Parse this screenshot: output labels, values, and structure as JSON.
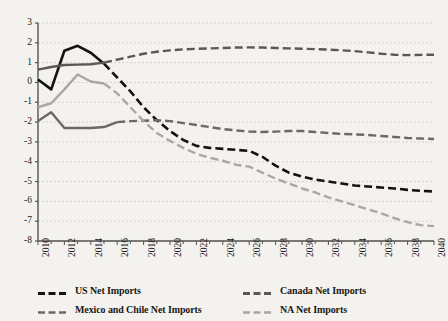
{
  "chart_data": {
    "type": "line",
    "title": "",
    "subtitle": "",
    "xlabel": "",
    "ylabel": "",
    "xlim": [
      2010,
      2040
    ],
    "ylim": [
      -8,
      3
    ],
    "grid": true,
    "legend_position": "bottom",
    "y_ticks": [
      3,
      2,
      1,
      0,
      -1,
      -2,
      -3,
      -4,
      -5,
      -6,
      -7,
      -8
    ],
    "y_tick_labels": [
      "3",
      "2",
      "1",
      "0",
      "-1",
      "-2",
      "-3",
      "-4",
      "-5",
      "-6",
      "-7",
      "-8"
    ],
    "x_ticks": [
      2010,
      2012,
      2014,
      2016,
      2018,
      2020,
      2022,
      2024,
      2026,
      2028,
      2030,
      2032,
      2034,
      2036,
      2038,
      2040
    ],
    "x_tick_labels": [
      "2010",
      "2012",
      "2014",
      "2016",
      "2018",
      "2020",
      "2022",
      "2024",
      "2026",
      "2028",
      "2030",
      "2032",
      "2034",
      "2036",
      "2038",
      "2040"
    ],
    "x": [
      2010,
      2011,
      2012,
      2013,
      2014,
      2015,
      2016,
      2017,
      2018,
      2019,
      2020,
      2021,
      2022,
      2023,
      2024,
      2025,
      2026,
      2027,
      2028,
      2029,
      2030,
      2031,
      2032,
      2033,
      2034,
      2035,
      2036,
      2037,
      2038,
      2039,
      2040
    ],
    "series": [
      {
        "name": "US Net Imports",
        "color": "#141210",
        "width": 2.6,
        "dash": "8,4",
        "solid_until": 2015,
        "values": [
          0.15,
          -0.35,
          1.6,
          1.85,
          1.5,
          0.95,
          0.25,
          -0.45,
          -1.25,
          -1.9,
          -2.45,
          -2.9,
          -3.2,
          -3.3,
          -3.35,
          -3.4,
          -3.45,
          -3.75,
          -4.2,
          -4.55,
          -4.75,
          -4.9,
          -5.0,
          -5.1,
          -5.2,
          -5.25,
          -5.3,
          -5.35,
          -5.42,
          -5.47,
          -5.5
        ]
      },
      {
        "name": "Canada Net Imports",
        "color": "#5a5852",
        "width": 2.4,
        "dash": "8,4",
        "solid_until": 2015,
        "values": [
          0.65,
          0.78,
          0.88,
          0.9,
          0.92,
          1.0,
          1.15,
          1.3,
          1.45,
          1.55,
          1.62,
          1.67,
          1.7,
          1.72,
          1.74,
          1.76,
          1.77,
          1.76,
          1.74,
          1.72,
          1.7,
          1.68,
          1.66,
          1.62,
          1.58,
          1.52,
          1.45,
          1.4,
          1.38,
          1.39,
          1.4
        ]
      },
      {
        "name": "Mexico and Chile Net Imports",
        "color": "#6b6963",
        "width": 2.4,
        "dash": "8,4",
        "solid_until": 2016,
        "values": [
          -1.95,
          -1.5,
          -2.3,
          -2.3,
          -2.3,
          -2.25,
          -2.0,
          -1.95,
          -1.93,
          -1.9,
          -1.95,
          -2.05,
          -2.15,
          -2.25,
          -2.35,
          -2.42,
          -2.48,
          -2.5,
          -2.48,
          -2.45,
          -2.45,
          -2.5,
          -2.55,
          -2.6,
          -2.62,
          -2.65,
          -2.7,
          -2.75,
          -2.8,
          -2.83,
          -2.85
        ]
      },
      {
        "name": "NA Net Imports",
        "color": "#a9a7a2",
        "width": 2.4,
        "dash": "8,4",
        "solid_until": 2015,
        "values": [
          -1.25,
          -1.05,
          -0.35,
          0.4,
          0.05,
          -0.05,
          -0.55,
          -1.25,
          -1.95,
          -2.55,
          -2.95,
          -3.3,
          -3.6,
          -3.8,
          -3.95,
          -4.15,
          -4.25,
          -4.55,
          -4.85,
          -5.1,
          -5.35,
          -5.55,
          -5.8,
          -6.0,
          -6.2,
          -6.4,
          -6.6,
          -6.85,
          -7.05,
          -7.2,
          -7.25
        ]
      }
    ]
  },
  "legend": {
    "items": [
      {
        "label": "US Net Imports",
        "color": "#141210",
        "thick": true
      },
      {
        "label": "Canada Net Imports",
        "color": "#5a5852",
        "thick": true
      },
      {
        "label": "Mexico and Chile Net Imports",
        "color": "#6b6963",
        "thick": false
      },
      {
        "label": "NA Net Imports",
        "color": "#a9a7a2",
        "thick": false
      }
    ]
  },
  "theme": {
    "background": "#f4f2ef",
    "axis_color": "#55534e",
    "grid_color": "#c9c6c0",
    "text_color": "#22201e"
  }
}
